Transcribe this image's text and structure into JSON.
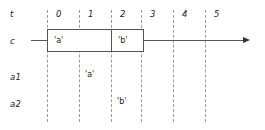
{
  "diagram": {
    "type": "timing-diagram",
    "width": 265,
    "height": 130,
    "colors": {
      "background": "#ffffff",
      "gridline": "#9a9a9a",
      "stroke": "#555555",
      "text": "#222222"
    },
    "time_axis": {
      "label": "t",
      "ticks": [
        "0",
        "1",
        "2",
        "3",
        "4",
        "5"
      ],
      "gridline_x": [
        47,
        79,
        111,
        141,
        173,
        205
      ]
    },
    "rows": [
      {
        "label": "t"
      },
      {
        "label": "c"
      },
      {
        "label": "a1"
      },
      {
        "label": "a2"
      }
    ],
    "signal_c": {
      "label": "c",
      "lead_line": {
        "x1": 31,
        "x2": 47
      },
      "cells": [
        {
          "text": "'a'",
          "start_x": 47,
          "end_x": 111
        },
        {
          "text": "'b'",
          "start_x": 111,
          "end_x": 143
        }
      ],
      "trail_line": {
        "x1": 143,
        "x2": 250
      },
      "arrow_x": 243
    },
    "events": [
      {
        "row": "a1",
        "text": "'a'",
        "x": 85,
        "y": 73
      },
      {
        "row": "a2",
        "text": "'b'",
        "x": 117,
        "y": 100
      }
    ]
  }
}
